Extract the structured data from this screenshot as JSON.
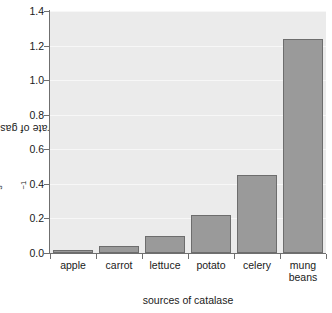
{
  "chart_data": {
    "type": "bar",
    "title": "",
    "subtitle": "",
    "xlabel": "sources of catalase",
    "ylabel": "rate of gas production/cm³ s⁻¹",
    "ylabel_parts": {
      "prefix": "rate of gas production/cm",
      "sup1": "3",
      "mid": " s",
      "sup2": "−1"
    },
    "categories": [
      "apple",
      "carrot",
      "lettuce",
      "potato",
      "celery",
      "mung beans"
    ],
    "category_lines": [
      [
        "apple"
      ],
      [
        "carrot"
      ],
      [
        "lettuce"
      ],
      [
        "potato"
      ],
      [
        "celery"
      ],
      [
        "mung",
        "beans"
      ]
    ],
    "values": [
      0.02,
      0.04,
      0.1,
      0.22,
      0.45,
      1.24
    ],
    "ylim": [
      0.0,
      1.4
    ],
    "ytick_values": [
      0.0,
      0.2,
      0.4,
      0.6,
      0.8,
      1.0,
      1.2,
      1.4
    ],
    "ytick_labels": [
      "0.0",
      "0.2",
      "0.4",
      "0.6",
      "0.8",
      "1.0",
      "1.2",
      "1.4"
    ],
    "grid": true,
    "grid_axis": "y",
    "legend": false,
    "legend_position": "none",
    "colors": {
      "plot_background": "#ebebeb",
      "figure_background": "#ffffff",
      "bar_fill": "#9a9a9a",
      "bar_edge": "#6d6d6d",
      "gridline": "#f7f7f7",
      "axis_line": "#6f6f6f",
      "text": "#1a1a1a"
    }
  }
}
